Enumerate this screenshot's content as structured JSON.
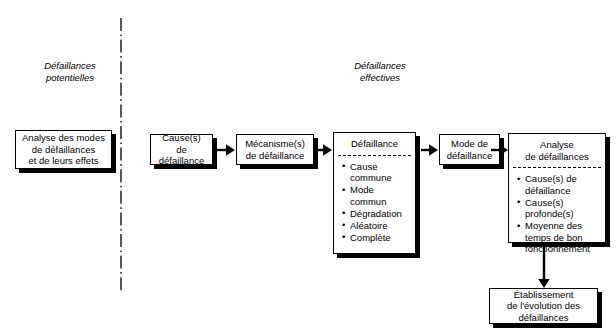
{
  "diagram": {
    "background_color": "#ffffff",
    "line_color": "#000000",
    "shadow_color": "#000000",
    "sections": [
      {
        "id": "potentielles",
        "label": "Défaillances\npotentielles"
      },
      {
        "id": "effectives",
        "label": "Défaillances\neffectives"
      }
    ],
    "divider": {
      "style": "dash-dot",
      "orientation": "vertical"
    },
    "boxes": [
      {
        "id": "amde",
        "title": "Analyse des modes\nde défaillances\net de leurs effets"
      },
      {
        "id": "causes",
        "title": "Cause(s)\nde défaillance"
      },
      {
        "id": "mecanismes",
        "title": "Mécanisme(s)\nde défaillance"
      },
      {
        "id": "defaillance",
        "title": "Défaillance",
        "items": [
          "Cause commune",
          "Mode commun",
          "Dégradation",
          "Aléatoire",
          "Complète"
        ]
      },
      {
        "id": "mode",
        "title": "Mode de\ndéfaillance"
      },
      {
        "id": "analyse",
        "title": "Analyse\nde défaillances",
        "items": [
          "Cause(s) de défaillance",
          "Cause(s) profonde(s)",
          "Moyenne des temps de bon fonctionnement"
        ]
      },
      {
        "id": "etablissement",
        "title": "Établissement\nde l'évolution des\ndéfaillances"
      }
    ],
    "arrows": [
      {
        "id": "causes-to-mecanismes",
        "direction": "right"
      },
      {
        "id": "mecanismes-to-defaillance",
        "direction": "right"
      },
      {
        "id": "defaillance-to-mode",
        "direction": "right"
      },
      {
        "id": "mode-to-analyse",
        "direction": "right"
      },
      {
        "id": "analyse-to-etablissement",
        "direction": "down"
      }
    ]
  }
}
